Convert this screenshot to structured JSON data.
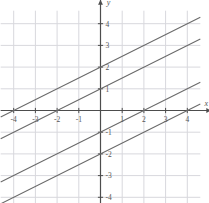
{
  "chart_data": {
    "type": "line",
    "title": "",
    "subtitle": "",
    "xlabel": "x",
    "ylabel": "y",
    "xlim": [
      -4.6,
      4.6
    ],
    "ylim": [
      -4.6,
      4.6
    ],
    "grid": true,
    "grid_step": 1,
    "legend": "none",
    "x_ticks": [
      -4,
      -3,
      -2,
      -1,
      1,
      2,
      3,
      4
    ],
    "y_ticks": [
      4,
      3,
      2,
      1,
      -1,
      -2,
      -3,
      -4
    ],
    "x_tick_labels": [
      "-4",
      "-3",
      "-2",
      "-1",
      "1",
      "2",
      "3",
      "4"
    ],
    "y_tick_labels": [
      "4",
      "3",
      "2",
      "1",
      "-1",
      "-2",
      "-3",
      "-4"
    ],
    "axis_arrows": [
      "x-positive",
      "y-positive"
    ],
    "series": [
      {
        "name": "line-1",
        "slope": 0.5,
        "intercept": 2,
        "equation": "y = 0.5x + 2",
        "x": [
          -4.6,
          4.6
        ],
        "values": [
          -0.3,
          4.3
        ],
        "color": "#6b6b6b"
      },
      {
        "name": "line-2",
        "slope": 0.5,
        "intercept": 1,
        "equation": "y = 0.5x + 1",
        "x": [
          -4.6,
          4.6
        ],
        "values": [
          -1.3,
          3.3
        ],
        "color": "#6b6b6b"
      },
      {
        "name": "line-3",
        "slope": 0.5,
        "intercept": -1,
        "equation": "y = 0.5x - 1",
        "x": [
          -4.6,
          4.6
        ],
        "values": [
          -3.3,
          1.3
        ],
        "color": "#6b6b6b"
      },
      {
        "name": "line-4",
        "slope": 0.5,
        "intercept": -2,
        "equation": "y = 0.5x - 2",
        "x": [
          -4.6,
          4.6
        ],
        "values": [
          -4.3,
          0.3
        ],
        "color": "#6b6b6b"
      }
    ],
    "colors": {
      "line": "#6b6b6b",
      "axis": "#4d4d4d",
      "grid": "#d8d8dd",
      "tick_text": "#555555",
      "background": "#ffffff"
    }
  }
}
